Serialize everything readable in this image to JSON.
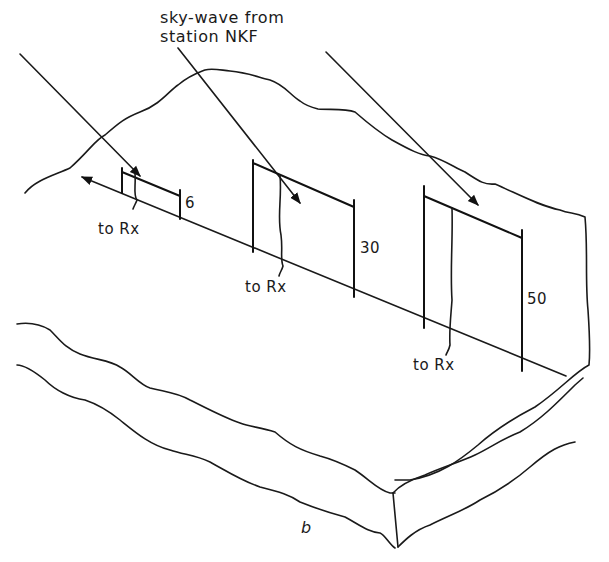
{
  "diagram": {
    "title_line1": "sky-wave from",
    "title_line2": "station NKF",
    "panel_label": "b",
    "antennas": [
      {
        "height_label": "6",
        "feed_label": "to Rx"
      },
      {
        "height_label": "30",
        "feed_label": "to Rx"
      },
      {
        "height_label": "50",
        "feed_label": "to Rx"
      }
    ],
    "colors": {
      "ink": "#1a1a1a",
      "background": "#ffffff"
    }
  }
}
